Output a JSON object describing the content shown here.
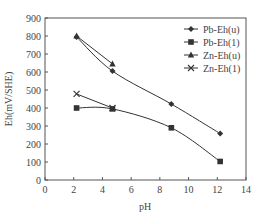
{
  "chart_data": {
    "type": "line",
    "title": "",
    "xlabel": "pH",
    "ylabel": "Eh(mV/SHE)",
    "xlim": [
      0,
      14
    ],
    "ylim": [
      0,
      900
    ],
    "xticks": [
      0,
      2,
      4,
      6,
      8,
      10,
      12,
      14
    ],
    "yticks": [
      0,
      100,
      200,
      300,
      400,
      500,
      600,
      700,
      800,
      900
    ],
    "grid": false,
    "legend_position": "upper right",
    "series": [
      {
        "name": "Pb-Eh(u)",
        "marker": "diamond",
        "x": [
          2.2,
          4.7,
          8.8,
          12.2
        ],
        "y": [
          795,
          605,
          422,
          258
        ]
      },
      {
        "name": "Pb-Eh(1)",
        "marker": "square",
        "x": [
          2.2,
          4.7,
          8.8,
          12.2
        ],
        "y": [
          400,
          395,
          290,
          103
        ]
      },
      {
        "name": "Zn-Eh(u)",
        "marker": "triangle",
        "x": [
          2.2,
          4.7
        ],
        "y": [
          800,
          645
        ]
      },
      {
        "name": "Zn-Eh(1)",
        "marker": "cross",
        "x": [
          2.2,
          4.7
        ],
        "y": [
          478,
          400
        ]
      }
    ]
  },
  "colors": {
    "line": "#333333",
    "axis": "#555555"
  }
}
